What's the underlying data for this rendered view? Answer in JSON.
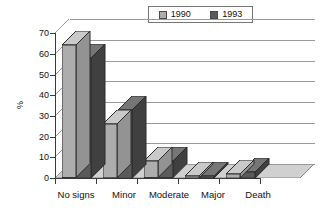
{
  "chart_data": {
    "type": "bar",
    "title": "",
    "subtitle": "",
    "xlabel": "",
    "ylabel": "%",
    "categories": [
      "No signs",
      "Minor",
      "Moderate",
      "Major",
      "Death"
    ],
    "series": [
      {
        "name": "1990",
        "values": [
          64,
          26,
          8,
          1,
          2
        ],
        "color": "#ADADAD"
      },
      {
        "name": "1993",
        "values": [
          58,
          33,
          8,
          1,
          3
        ],
        "color": "#5A5A5A"
      }
    ],
    "ylim": [
      0,
      70
    ],
    "yticks": [
      0,
      10,
      20,
      30,
      40,
      50,
      60,
      70
    ],
    "ytick_labels": [
      "0",
      "10",
      "20",
      "30",
      "40",
      "50",
      "60",
      "70"
    ],
    "grid": true,
    "grid_axis": "y",
    "legend_position": "top-center",
    "three_d": true,
    "plot_background": "#FFFFFF",
    "floor_color": "#D0D0D0",
    "axis_color": "#3A3A3A",
    "gridline_color": "#9A9A9A"
  },
  "legend": {
    "entries": [
      {
        "label": "1990",
        "swatch_color": "#ADADAD"
      },
      {
        "label": "1993",
        "swatch_color": "#5A5A5A"
      }
    ]
  },
  "axes": {
    "y_title": "%",
    "y_tick_labels": [
      "70",
      "60",
      "50",
      "40",
      "30",
      "20",
      "10",
      "0"
    ],
    "x_tick_labels": [
      "No signs",
      "Minor",
      "Moderate",
      "Major",
      "Death"
    ]
  }
}
